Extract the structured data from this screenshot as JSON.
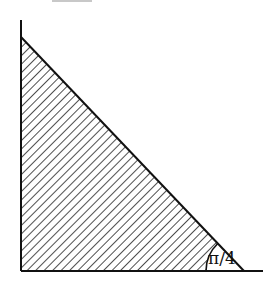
{
  "diagram": {
    "type": "right-triangle-hatched-region",
    "top_cropped_text": "",
    "angle_label": "π/4",
    "colors": {
      "line": "#111111",
      "hatch": "#222222",
      "background": "#ffffff"
    }
  }
}
